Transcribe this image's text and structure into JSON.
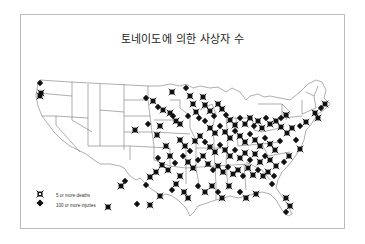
{
  "title": "토네이도에 의한 사상자 수",
  "legend": {
    "items": [
      {
        "label": "5 or more deaths",
        "symbol": "x-box"
      },
      {
        "label": "100 or more injuries",
        "symbol": "plus-diamond"
      }
    ]
  },
  "colors": {
    "marker": "#111111",
    "outline": "#777777",
    "frame": "#bdbdbd"
  },
  "markers": [
    [
      40,
      83
    ],
    [
      41,
      93
    ],
    [
      40,
      96
    ],
    [
      146,
      98
    ],
    [
      153,
      101
    ],
    [
      172,
      92
    ],
    [
      186,
      88
    ],
    [
      190,
      96
    ],
    [
      203,
      97
    ],
    [
      158,
      107
    ],
    [
      163,
      110
    ],
    [
      170,
      113
    ],
    [
      173,
      116
    ],
    [
      176,
      121
    ],
    [
      180,
      124
    ],
    [
      188,
      116
    ],
    [
      193,
      104
    ],
    [
      196,
      112
    ],
    [
      199,
      118
    ],
    [
      205,
      105
    ],
    [
      210,
      111
    ],
    [
      214,
      116
    ],
    [
      218,
      104
    ],
    [
      222,
      109
    ],
    [
      226,
      115
    ],
    [
      230,
      120
    ],
    [
      235,
      125
    ],
    [
      240,
      118
    ],
    [
      245,
      124
    ],
    [
      250,
      118
    ],
    [
      254,
      126
    ],
    [
      258,
      121
    ],
    [
      262,
      128
    ],
    [
      266,
      118
    ],
    [
      270,
      124
    ],
    [
      276,
      121
    ],
    [
      281,
      118
    ],
    [
      286,
      115
    ],
    [
      281,
      127
    ],
    [
      205,
      121
    ],
    [
      210,
      128
    ],
    [
      215,
      133
    ],
    [
      220,
      126
    ],
    [
      225,
      132
    ],
    [
      230,
      138
    ],
    [
      235,
      131
    ],
    [
      240,
      136
    ],
    [
      245,
      142
    ],
    [
      250,
      134
    ],
    [
      255,
      140
    ],
    [
      260,
      146
    ],
    [
      265,
      138
    ],
    [
      270,
      144
    ],
    [
      275,
      150
    ],
    [
      280,
      141
    ],
    [
      287,
      133
    ],
    [
      292,
      128
    ],
    [
      300,
      126
    ],
    [
      306,
      122
    ],
    [
      315,
      113
    ],
    [
      321,
      108
    ],
    [
      325,
      104
    ],
    [
      318,
      118
    ],
    [
      296,
      140
    ],
    [
      300,
      149
    ],
    [
      289,
      156
    ],
    [
      284,
      162
    ],
    [
      180,
      140
    ],
    [
      185,
      146
    ],
    [
      190,
      151
    ],
    [
      195,
      141
    ],
    [
      200,
      136
    ],
    [
      205,
      142
    ],
    [
      210,
      147
    ],
    [
      215,
      152
    ],
    [
      220,
      145
    ],
    [
      225,
      150
    ],
    [
      230,
      156
    ],
    [
      235,
      150
    ],
    [
      240,
      158
    ],
    [
      245,
      153
    ],
    [
      250,
      160
    ],
    [
      255,
      154
    ],
    [
      260,
      162
    ],
    [
      265,
      156
    ],
    [
      270,
      160
    ],
    [
      276,
      166
    ],
    [
      183,
      156
    ],
    [
      188,
      162
    ],
    [
      193,
      168
    ],
    [
      198,
      160
    ],
    [
      203,
      156
    ],
    [
      208,
      164
    ],
    [
      213,
      170
    ],
    [
      218,
      166
    ],
    [
      223,
      172
    ],
    [
      228,
      167
    ],
    [
      233,
      174
    ],
    [
      238,
      170
    ],
    [
      243,
      176
    ],
    [
      248,
      168
    ],
    [
      253,
      175
    ],
    [
      258,
      170
    ],
    [
      263,
      176
    ],
    [
      268,
      172
    ],
    [
      274,
      176
    ],
    [
      166,
      146
    ],
    [
      170,
      156
    ],
    [
      175,
      163
    ],
    [
      168,
      170
    ],
    [
      162,
      165
    ],
    [
      158,
      158
    ],
    [
      156,
      172
    ],
    [
      150,
      177
    ],
    [
      146,
      185
    ],
    [
      180,
      176
    ],
    [
      176,
      184
    ],
    [
      172,
      190
    ],
    [
      184,
      192
    ],
    [
      188,
      198
    ],
    [
      198,
      186
    ],
    [
      205,
      192
    ],
    [
      212,
      186
    ],
    [
      218,
      192
    ],
    [
      222,
      198
    ],
    [
      229,
      186
    ],
    [
      240,
      192
    ],
    [
      246,
      198
    ],
    [
      256,
      194
    ],
    [
      272,
      184
    ],
    [
      286,
      198
    ],
    [
      290,
      206
    ],
    [
      286,
      212
    ],
    [
      160,
      196
    ],
    [
      150,
      205
    ],
    [
      137,
      204
    ],
    [
      108,
      207
    ],
    [
      121,
      186
    ],
    [
      125,
      181
    ],
    [
      157,
      135
    ],
    [
      160,
      126
    ],
    [
      148,
      124
    ],
    [
      135,
      130
    ]
  ]
}
